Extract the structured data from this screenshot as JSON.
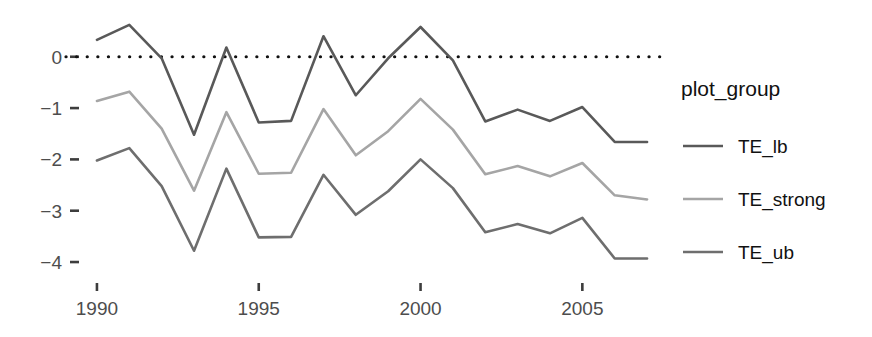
{
  "chart_data": {
    "type": "line",
    "title": "",
    "xlabel": "",
    "ylabel": "",
    "xlim": [
      1989.6,
      2007.4
    ],
    "ylim": [
      -4.35,
      0.95
    ],
    "grid": false,
    "legend_position": "right",
    "legend_title": "plot_group",
    "x_ticks": [
      1990,
      1995,
      2000,
      2005
    ],
    "x_tick_labels": [
      "1990",
      "1995",
      "2000",
      "2005"
    ],
    "y_ticks": [
      0,
      -1,
      -2,
      -3,
      -4
    ],
    "y_tick_labels": [
      "0",
      "−1",
      "−2",
      "−3",
      "−4"
    ],
    "annotations": [
      {
        "name": "zero-reference-line",
        "type": "hline",
        "y": 0,
        "style": "dotted",
        "color": "#111111"
      }
    ],
    "x": [
      1990,
      1991,
      1992,
      1993,
      1994,
      1995,
      1996,
      1997,
      1998,
      1999,
      2000,
      2001,
      2002,
      2003,
      2004,
      2005,
      2006,
      2007
    ],
    "series": [
      {
        "name": "TE_lb",
        "color": "#595959",
        "values": [
          0.33,
          0.62,
          -0.03,
          -1.52,
          0.18,
          -1.28,
          -1.25,
          0.4,
          -0.75,
          -0.03,
          0.58,
          -0.07,
          -1.26,
          -1.03,
          -1.25,
          -0.98,
          -1.66,
          -1.66
        ]
      },
      {
        "name": "TE_strong",
        "color": "#a5a5a5",
        "values": [
          -0.86,
          -0.68,
          -1.4,
          -2.61,
          -1.08,
          -2.28,
          -2.26,
          -1.02,
          -1.92,
          -1.45,
          -0.82,
          -1.42,
          -2.29,
          -2.13,
          -2.33,
          -2.07,
          -2.7,
          -2.78
        ]
      },
      {
        "name": "TE_ub",
        "color": "#6e6e6e",
        "values": [
          -2.02,
          -1.78,
          -2.52,
          -3.78,
          -2.18,
          -3.52,
          -3.51,
          -2.3,
          -3.08,
          -2.62,
          -2.0,
          -2.56,
          -3.42,
          -3.26,
          -3.44,
          -3.14,
          -3.93,
          -3.93
        ]
      }
    ]
  },
  "legend": {
    "title": "plot_group",
    "items": [
      {
        "label": "TE_lb",
        "color": "#595959"
      },
      {
        "label": "TE_strong",
        "color": "#a5a5a5"
      },
      {
        "label": "TE_ub",
        "color": "#6e6e6e"
      }
    ]
  }
}
